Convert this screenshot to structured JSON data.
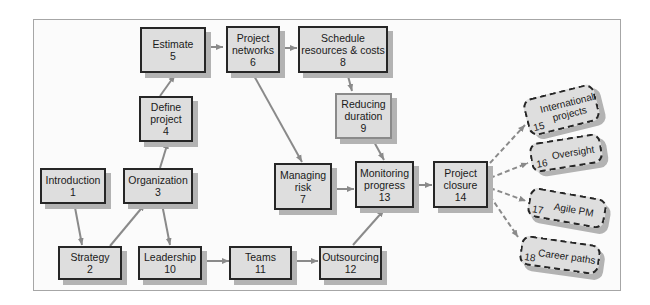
{
  "diagram": {
    "type": "flowchart",
    "title": "",
    "colors": {
      "node_fill": "#dedede",
      "node_border": "#262626",
      "arrow": "#8a8a8a",
      "shadow": "#b3b3b3"
    },
    "nodes": [
      {
        "id": "1",
        "label": "Introduction",
        "number": "1"
      },
      {
        "id": "2",
        "label": "Strategy",
        "number": "2"
      },
      {
        "id": "3",
        "label": "Organization",
        "number": "3"
      },
      {
        "id": "4",
        "label": "Define project",
        "number": "4"
      },
      {
        "id": "5",
        "label": "Estimate",
        "number": "5"
      },
      {
        "id": "6",
        "label": "Project networks",
        "number": "6"
      },
      {
        "id": "7",
        "label": "Managing risk",
        "number": "7"
      },
      {
        "id": "8",
        "label": "Schedule resources & costs",
        "number": "8"
      },
      {
        "id": "9",
        "label": "Reducing duration",
        "number": "9"
      },
      {
        "id": "10",
        "label": "Leadership",
        "number": "10"
      },
      {
        "id": "11",
        "label": "Teams",
        "number": "11"
      },
      {
        "id": "12",
        "label": "Outsourcing",
        "number": "12"
      },
      {
        "id": "13",
        "label": "Monitoring progress",
        "number": "13"
      },
      {
        "id": "14",
        "label": "Project closure",
        "number": "14"
      },
      {
        "id": "15",
        "label": "International projects",
        "number": "15",
        "style": "dashed"
      },
      {
        "id": "16",
        "label": "Oversight",
        "number": "16",
        "style": "dashed"
      },
      {
        "id": "17",
        "label": "Agile PM",
        "number": "17",
        "style": "dashed"
      },
      {
        "id": "18",
        "label": "Career paths",
        "number": "18",
        "style": "dashed"
      }
    ],
    "edges": [
      [
        "1",
        "2"
      ],
      [
        "2",
        "3"
      ],
      [
        "3",
        "4"
      ],
      [
        "3",
        "10"
      ],
      [
        "4",
        "5"
      ],
      [
        "5",
        "6"
      ],
      [
        "6",
        "8"
      ],
      [
        "6",
        "7"
      ],
      [
        "8",
        "9"
      ],
      [
        "9",
        "13"
      ],
      [
        "7",
        "13"
      ],
      [
        "10",
        "11"
      ],
      [
        "11",
        "12"
      ],
      [
        "12",
        "13"
      ],
      [
        "13",
        "14"
      ],
      [
        "14",
        "15"
      ],
      [
        "14",
        "16"
      ],
      [
        "14",
        "17"
      ],
      [
        "14",
        "18"
      ]
    ],
    "labels": {
      "n1": [
        "Introduction",
        "1"
      ],
      "n2": [
        "Strategy",
        "2"
      ],
      "n3": [
        "Organization",
        "3"
      ],
      "n4": [
        "Define",
        "project",
        "4"
      ],
      "n5": [
        "Estimate",
        "5"
      ],
      "n6": [
        "Project",
        "networks",
        "6"
      ],
      "n7": [
        "Managing",
        "risk",
        "7"
      ],
      "n8": [
        "Schedule",
        "resources & costs",
        "8"
      ],
      "n9": [
        "Reducing",
        "duration",
        "9"
      ],
      "n10": [
        "Leadership",
        "10"
      ],
      "n11": [
        "Teams",
        "11"
      ],
      "n12": [
        "Outsourcing",
        "12"
      ],
      "n13": [
        "Monitoring",
        "progress",
        "13"
      ],
      "n14": [
        "Project",
        "closure",
        "14"
      ],
      "n15": [
        "International",
        "projects",
        "15"
      ],
      "n16": [
        "Oversight",
        "16"
      ],
      "n17": [
        "Agile PM",
        "17"
      ],
      "n18": [
        "Career paths",
        "18"
      ]
    }
  }
}
